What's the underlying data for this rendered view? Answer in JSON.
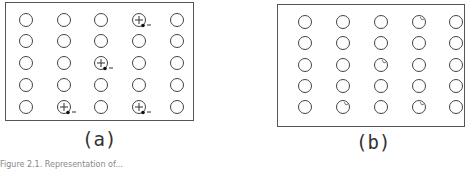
{
  "figure": {
    "panels": [
      {
        "label": "(a)",
        "rows": 5,
        "cols": 5,
        "description": "Lattice of ions with electron-hole pairs shown as plus sign with adjacent electron and minus sign",
        "marked_sites": [
          [
            0,
            3
          ],
          [
            2,
            2
          ],
          [
            4,
            1
          ],
          [
            4,
            3
          ]
        ],
        "marker": "plus-with-electron-minus"
      },
      {
        "label": "(b)",
        "rows": 5,
        "cols": 5,
        "description": "Same lattice with small notch marks on the previously marked sites",
        "marked_sites": [
          [
            0,
            3
          ],
          [
            2,
            2
          ],
          [
            4,
            1
          ],
          [
            4,
            3
          ]
        ],
        "marker": "small-notch"
      }
    ],
    "caption": "Figure 2.1. Representation of..."
  }
}
